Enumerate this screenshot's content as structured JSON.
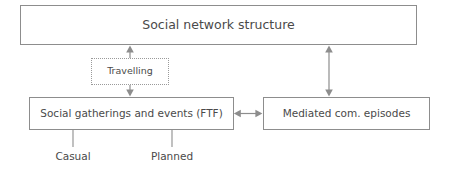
{
  "diagram": {
    "stroke_color": "#8d8d8d",
    "text_color": "#4a4a4a",
    "background_color": "#ffffff",
    "nodes": [
      {
        "id": "social-network-structure",
        "label": "Social network structure",
        "border": "solid",
        "x": 20,
        "y": 5,
        "width": 397,
        "height": 40
      },
      {
        "id": "travelling",
        "label": "Travelling",
        "border": "dotted",
        "x": 91,
        "y": 58,
        "width": 78,
        "height": 27
      },
      {
        "id": "social-gatherings",
        "label": "Social gatherings and events (FTF)",
        "border": "solid",
        "x": 29,
        "y": 97,
        "width": 205,
        "height": 33
      },
      {
        "id": "mediated-episodes",
        "label": "Mediated com. episodes",
        "border": "solid",
        "x": 263,
        "y": 97,
        "width": 167,
        "height": 33
      }
    ],
    "leaf_labels": [
      {
        "id": "casual",
        "label": "Casual",
        "x": 73,
        "y": 150
      },
      {
        "id": "planned",
        "label": "Planned",
        "x": 172,
        "y": 150
      }
    ],
    "connectors": [
      {
        "id": "travelling-to-network",
        "from": "travelling",
        "to": "social-network-structure",
        "direction": "up",
        "arrowheads": "end"
      },
      {
        "id": "travelling-to-gatherings",
        "from": "travelling",
        "to": "social-gatherings",
        "direction": "down",
        "arrowheads": "end"
      },
      {
        "id": "network-to-mediated",
        "from": "social-network-structure",
        "to": "mediated-episodes",
        "direction": "vertical",
        "arrowheads": "both"
      },
      {
        "id": "gatherings-to-mediated",
        "from": "social-gatherings",
        "to": "mediated-episodes",
        "direction": "horizontal",
        "arrowheads": "both"
      },
      {
        "id": "gatherings-to-casual",
        "from": "social-gatherings",
        "to": "casual",
        "direction": "down",
        "arrowheads": "none"
      },
      {
        "id": "gatherings-to-planned",
        "from": "social-gatherings",
        "to": "planned",
        "direction": "down",
        "arrowheads": "none"
      }
    ]
  }
}
